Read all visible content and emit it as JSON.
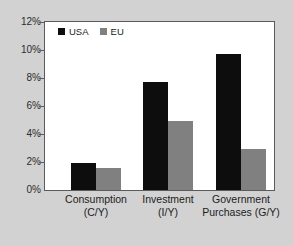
{
  "chart_data": {
    "type": "bar",
    "title": "",
    "subtitle": "",
    "xlabel": "",
    "ylabel": "",
    "categories": [
      "Consumption (C/Y)",
      "Investment (I/Y)",
      "Government Purchases (G/Y)"
    ],
    "category_lines": [
      [
        "Consumption",
        "(C/Y)"
      ],
      [
        "Investment",
        "(I/Y)"
      ],
      [
        "Government",
        "Purchases (G/Y)"
      ]
    ],
    "series": [
      {
        "name": "USA",
        "color": "#0d0d0d",
        "values": [
          1.9,
          7.75,
          9.7
        ]
      },
      {
        "name": "EU",
        "color": "#808080",
        "values": [
          1.6,
          4.9,
          2.9
        ]
      }
    ],
    "ylim": [
      0,
      12
    ],
    "ytick_values": [
      0,
      2,
      4,
      6,
      8,
      10,
      12
    ],
    "ytick_labels": [
      "0%",
      "2%",
      "4%",
      "6%",
      "8%",
      "10%",
      "12%"
    ],
    "grid": false,
    "legend_position": "top-left",
    "value_unit": "%"
  },
  "colors": {
    "figure_background": "#d2d2d2",
    "plot_background": "#ffffff",
    "frame": "#5b5b5b",
    "usa": "#0d0d0d",
    "eu": "#808080",
    "text": "#1c1c1c"
  }
}
